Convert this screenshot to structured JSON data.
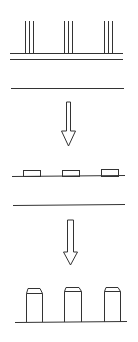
{
  "diagram": {
    "stroke_color": "#333333",
    "background": "#ffffff",
    "stages": [
      {
        "name": "exposure",
        "groups": 3,
        "lines_per_group": 3
      },
      {
        "name": "pads",
        "count": 3
      },
      {
        "name": "pillars",
        "count": 3
      }
    ],
    "arrows": 2
  }
}
